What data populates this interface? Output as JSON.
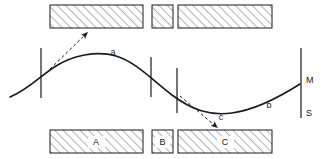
{
  "figure": {
    "name": "web-path-through-hatched-blocks-diagram",
    "background_color": "#ffffff",
    "line_color": "#1a1a1a",
    "hatch_color": "#9a9a9a",
    "block_fill": "#ffffff",
    "width": 329,
    "height": 159
  },
  "blocks": {
    "top": [
      {
        "id": "top-block-1",
        "label": "",
        "x": 50,
        "y": 5,
        "width": 93,
        "height": 23
      },
      {
        "id": "top-block-2",
        "label": "",
        "x": 152,
        "y": 5,
        "width": 21,
        "height": 23
      },
      {
        "id": "top-block-3",
        "label": "",
        "x": 178,
        "y": 5,
        "width": 94,
        "height": 23
      }
    ],
    "bottom": [
      {
        "id": "bottom-block-a",
        "label": "A",
        "x": 50,
        "y": 130,
        "width": 93,
        "height": 23,
        "label_x": 96,
        "label_y": 145
      },
      {
        "id": "bottom-block-b",
        "label": "B",
        "x": 152,
        "y": 130,
        "width": 21,
        "height": 23,
        "label_x": 162,
        "label_y": 145
      },
      {
        "id": "bottom-block-c",
        "label": "C",
        "x": 178,
        "y": 130,
        "width": 94,
        "height": 23,
        "label_x": 225,
        "label_y": 145
      }
    ]
  },
  "ticks": [
    {
      "id": "tick-left",
      "x": 41,
      "y1": 48,
      "y2": 98
    },
    {
      "id": "tick-mid-1",
      "x": 151,
      "y1": 57,
      "y2": 97
    },
    {
      "id": "tick-mid-2",
      "x": 177,
      "y1": 68,
      "y2": 113
    },
    {
      "id": "tick-right",
      "x": 301,
      "y1": 48,
      "y2": 118
    }
  ],
  "curve": {
    "id": "web-path",
    "path": "M 10 97 C 28 90 40 76 56 66 C 72 56 96 50 116 56 C 136 62 152 80 172 95 C 192 110 210 116 232 113 C 254 110 278 98 300 84",
    "stroke_width": 1.6
  },
  "annotations": {
    "arrows": [
      {
        "id": "arrow-top-left",
        "label": "",
        "from_x": 46,
        "from_y": 73,
        "to_x": 89,
        "to_y": 31,
        "style": "dashed"
      },
      {
        "id": "arrow-c",
        "label": "c",
        "from_x": 180,
        "from_y": 96,
        "to_x": 219,
        "to_y": 129,
        "style": "dashed"
      }
    ],
    "labels": [
      {
        "id": "label-a",
        "text": "a",
        "x": 113,
        "y": 55
      },
      {
        "id": "label-b",
        "text": "b",
        "x": 269,
        "y": 108
      },
      {
        "id": "label-c",
        "text": "c",
        "x": 221,
        "y": 120
      },
      {
        "id": "label-m",
        "text": "M",
        "x": 306,
        "y": 83
      },
      {
        "id": "label-s",
        "text": "S",
        "x": 306,
        "y": 115
      }
    ]
  }
}
